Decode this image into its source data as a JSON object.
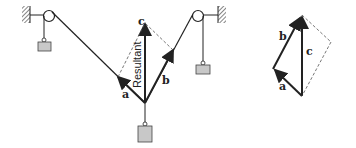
{
  "diagram": {
    "type": "force-vector-parallelogram",
    "left_figure": {
      "labels": {
        "a": "a",
        "b": "b",
        "c": "c",
        "resultant": "Resultant"
      },
      "components": [
        "wall-left",
        "pulley-left",
        "weight-left",
        "wall-right",
        "pulley-right",
        "weight-right",
        "weight-bottom"
      ]
    },
    "right_figure": {
      "labels": {
        "a": "a",
        "b": "b",
        "c": "c"
      }
    },
    "colors": {
      "line": "#222222",
      "weight_fill": "#c8c8c8",
      "dashed": "#555555",
      "hatch": "#333333"
    }
  }
}
